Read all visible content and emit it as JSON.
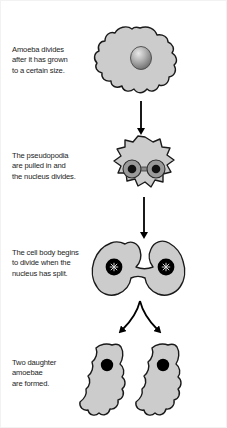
{
  "diagram": {
    "background_color": "#ffffff",
    "cell_fill_color": "#cccccc",
    "cell_outline_color": "#1a1a1a",
    "nucleus_dark_color": "#000000",
    "nucleus_mid_color": "#8a8a8a",
    "arrow_color": "#000000"
  },
  "steps": [
    {
      "id": "step-1",
      "caption": "Amoeba divides\nafter it has grown\nto a certain size.",
      "figure_name": "amoeba-single-cell",
      "nucleus_count": 1,
      "nucleus_style": "shaded-sphere"
    },
    {
      "id": "step-2",
      "caption": "The pseudopodia\nare pulled in and\nthe nucleus divides.",
      "figure_name": "amoeba-rounded-two-nuclei",
      "nucleus_count": 2,
      "nucleus_style": "ringed-pair-with-bridge"
    },
    {
      "id": "step-3",
      "caption": "The cell body begins\nto divide when the\nnucleus has split.",
      "figure_name": "amoeba-dumbbell-dividing",
      "nucleus_count": 2,
      "nucleus_style": "black-disc-with-star"
    },
    {
      "id": "step-4",
      "caption": "Two daughter\namoebae\nare formed.",
      "figure_name": "amoeba-two-daughter-cells",
      "nucleus_count": 2,
      "nucleus_style": "black-disc"
    }
  ],
  "arrows": [
    {
      "id": "arrow-1",
      "name": "arrow-step1-to-step2",
      "type": "straight-down"
    },
    {
      "id": "arrow-2",
      "name": "arrow-step2-to-step3",
      "type": "straight-down"
    },
    {
      "id": "arrow-3",
      "name": "arrow-step3-to-step4",
      "type": "forked-split"
    }
  ]
}
